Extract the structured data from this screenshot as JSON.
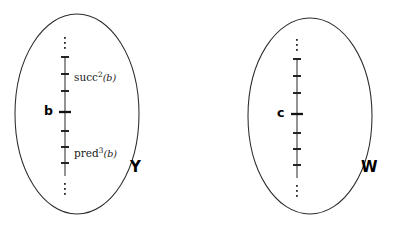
{
  "figure": {
    "type": "set-diagram",
    "background_color": "#ffffff",
    "stroke_color": "#2b2b2b"
  },
  "sets": [
    {
      "id": "Y",
      "label": "Y",
      "label_x": 130,
      "label_y": 168,
      "ellipse": {
        "cx": 77,
        "cy": 114,
        "rx": 62,
        "ry": 100
      },
      "chain": {
        "x": 65,
        "top_y": 56,
        "bottom_y": 176,
        "tick_count": 7,
        "tick_spacing": 20,
        "tick_half_width": 4,
        "major_tick_index": 3,
        "major_tick_half_width": 6,
        "ellipsis_above": [
          38,
          43,
          48
        ],
        "ellipsis_below": [
          184,
          189,
          194
        ]
      },
      "base_element": {
        "label": "b",
        "x": 44,
        "y": 109,
        "tick_index": 3
      },
      "annotations": [
        {
          "name": "succ-label",
          "base": "succ",
          "exponent": "2",
          "argument": "(b)",
          "x": 74,
          "y": 74,
          "tick_index": 1
        },
        {
          "name": "pred-label",
          "base": "pred",
          "exponent": "3",
          "argument": "(b)",
          "x": 74,
          "y": 150,
          "tick_index": 6
        }
      ]
    },
    {
      "id": "W",
      "label": "W",
      "label_x": 362,
      "label_y": 168,
      "ellipse": {
        "cx": 310,
        "cy": 116,
        "rx": 62,
        "ry": 98
      },
      "chain": {
        "x": 297,
        "top_y": 58,
        "bottom_y": 178,
        "tick_count": 7,
        "tick_spacing": 20,
        "tick_half_width": 4,
        "major_tick_index": 3,
        "major_tick_half_width": 6,
        "ellipsis_above": [
          40,
          45,
          50
        ],
        "ellipsis_below": [
          186,
          191,
          196
        ]
      },
      "base_element": {
        "label": "c",
        "x": 277,
        "y": 111,
        "tick_index": 3
      },
      "annotations": []
    }
  ]
}
